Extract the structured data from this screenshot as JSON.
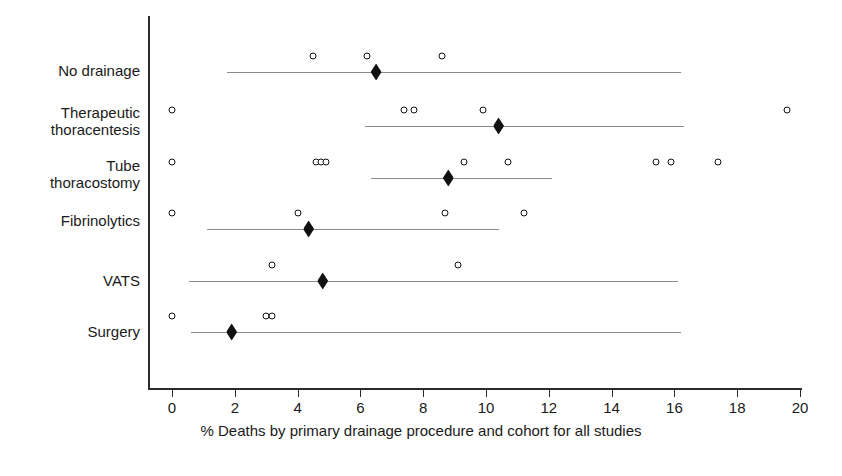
{
  "chart_data": {
    "type": "scatter",
    "title": "",
    "xlabel": "% Deaths by primary drainage procedure and cohort for all studies",
    "ylabel": "",
    "xlim": [
      0,
      20
    ],
    "xticks": [
      0,
      2,
      4,
      6,
      8,
      10,
      12,
      14,
      16,
      18,
      20
    ],
    "xtick_labels": [
      "0",
      "2",
      "4",
      "6",
      "8",
      "10",
      "12",
      "14",
      "16",
      "18",
      "20"
    ],
    "grid": false,
    "legend": "none",
    "categories": [
      "No drainage",
      "Therapeutic thoracentesis",
      "Tube thoracostomy",
      "Fibrinolytics",
      "VATS",
      "Surgery"
    ],
    "series": [
      {
        "name": "No drainage",
        "label_lines": [
          "No drainage"
        ],
        "study_points": [
          4.5,
          6.2,
          8.6
        ],
        "summary": 6.5,
        "ci_low": 1.75,
        "ci_high": 16.2
      },
      {
        "name": "Therapeutic thoracentesis",
        "label_lines": [
          "Therapeutic",
          "thoracentesis"
        ],
        "study_points": [
          0.0,
          7.4,
          7.7,
          9.9,
          19.6
        ],
        "summary": 10.4,
        "ci_low": 6.15,
        "ci_high": 16.3
      },
      {
        "name": "Tube thoracostomy",
        "label_lines": [
          "Tube",
          "thoracostomy"
        ],
        "study_points": [
          0.0,
          4.6,
          4.75,
          4.9,
          9.3,
          10.7,
          15.4,
          15.9,
          17.4
        ],
        "summary": 8.8,
        "ci_low": 6.35,
        "ci_high": 12.1
      },
      {
        "name": "Fibrinolytics",
        "label_lines": [
          "Fibrinolytics"
        ],
        "study_points": [
          0.0,
          4.0,
          8.7,
          11.2
        ],
        "summary": 4.35,
        "ci_low": 1.1,
        "ci_high": 10.4
      },
      {
        "name": "VATS",
        "label_lines": [
          "VATS"
        ],
        "study_points": [
          3.2,
          9.1
        ],
        "summary": 4.8,
        "ci_low": 0.55,
        "ci_high": 16.1
      },
      {
        "name": "Surgery",
        "label_lines": [
          "Surgery"
        ],
        "study_points": [
          0.0,
          3.0,
          3.2
        ],
        "summary": 1.9,
        "ci_low": 0.6,
        "ci_high": 16.2
      }
    ],
    "marker_legend": {
      "study_point": "open circle = individual cohort",
      "summary": "filled diamond = pooled estimate"
    },
    "colors": {
      "axis": "#2b2b2b",
      "marker": "#111111",
      "ci_line": "#8a8a8a",
      "background": "#ffffff"
    }
  }
}
